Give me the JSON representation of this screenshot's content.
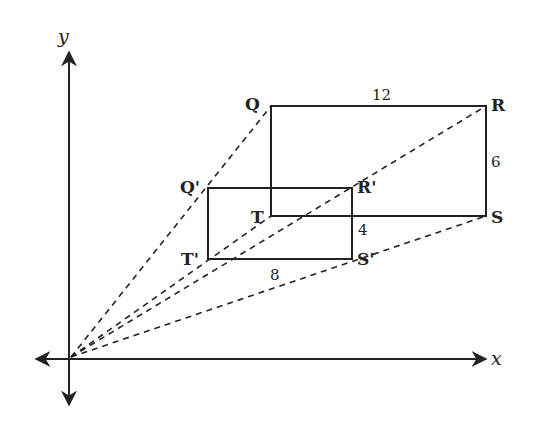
{
  "diagram": {
    "type": "dilation-on-coordinate-plane",
    "axes": {
      "x_label": "x",
      "y_label": "y"
    },
    "original_rectangle": {
      "vertices": [
        "Q",
        "R",
        "S",
        "T"
      ],
      "labels": {
        "Q": "Q",
        "R": "R",
        "S": "S",
        "T": "T"
      },
      "side_lengths": {
        "QR": "12",
        "RS": "6"
      }
    },
    "image_rectangle": {
      "vertices": [
        "Q'",
        "R'",
        "S'",
        "T'"
      ],
      "labels": {
        "Q": "Q'",
        "R": "R'",
        "S": "S'",
        "T": "T'"
      },
      "side_lengths": {
        "T'S'": "8",
        "R'S'": "4"
      }
    },
    "center_of_dilation": "origin",
    "colors": {
      "stroke": "#222222",
      "background": "#ffffff"
    }
  }
}
